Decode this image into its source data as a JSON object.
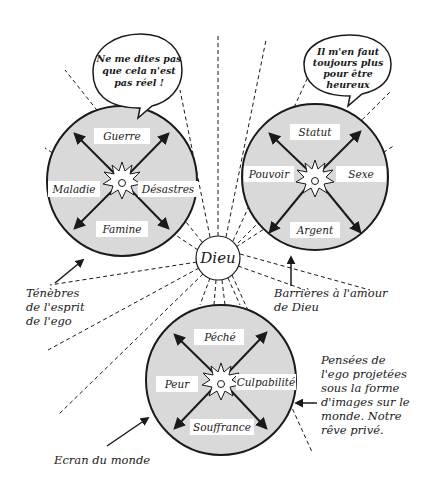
{
  "center": {
    "label": "Dieu"
  },
  "circles": [
    {
      "id": "left",
      "cx": 122,
      "cy": 181,
      "r": 75,
      "labels": {
        "top": "Guerre",
        "left": "Maladie",
        "right": "Désastres",
        "bottom": "Famine"
      },
      "bubble": {
        "lines": [
          "Ne me dites pas",
          "que cela n'est",
          "pas réel !"
        ]
      }
    },
    {
      "id": "right",
      "cx": 315,
      "cy": 177,
      "r": 73,
      "labels": {
        "top": "Statut",
        "left": "Pouvoir",
        "right": "Sexe",
        "bottom": "Argent"
      },
      "bubble": {
        "lines": [
          "Il m'en faut",
          "toujours plus",
          "pour être",
          "heureux"
        ]
      }
    },
    {
      "id": "bottom",
      "cx": 221,
      "cy": 380,
      "r": 75,
      "labels": {
        "top": "Péché",
        "left": "Peur",
        "right": "Culpabilité",
        "bottom": "Souffrance"
      }
    }
  ],
  "captions": {
    "tenebres": [
      "Ténèbres",
      "de l'esprit",
      "de l'ego"
    ],
    "barrieres": [
      "Barrières à l'amour",
      "de Dieu"
    ],
    "pensees": [
      "Pensées de",
      "l'ego projetées",
      "sous la forme",
      "d'images sur le",
      "monde. Notre",
      "rêve privé."
    ],
    "ecran": [
      "Ecran du monde"
    ]
  },
  "colors": {
    "disc_fill": "#d9d9d9",
    "ink": "#1a1a1a",
    "label_bg": "#ffffff"
  }
}
